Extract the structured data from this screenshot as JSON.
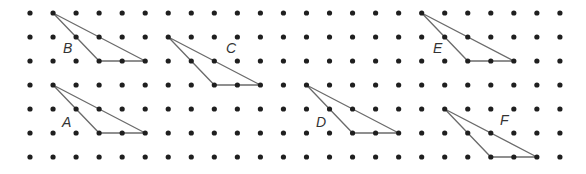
{
  "diagram": {
    "type": "dot-grid-triangles",
    "grid": {
      "columns": 24,
      "rows": 7,
      "origin_x": 30,
      "origin_y": 13,
      "spacing_x": 23.04,
      "spacing_y": 24,
      "dot_radius": 2.6,
      "dot_color": "#1f1f1f"
    },
    "line_color": "#6b6b6b",
    "triangles": [
      {
        "label": "B",
        "vertices": [
          [
            1,
            0
          ],
          [
            3,
            2
          ],
          [
            5,
            2
          ]
        ],
        "label_pos": [
          63,
          53
        ]
      },
      {
        "label": "C",
        "vertices": [
          [
            6,
            1
          ],
          [
            8,
            3
          ],
          [
            10,
            3
          ]
        ],
        "label_pos": [
          226,
          53
        ]
      },
      {
        "label": "E",
        "vertices": [
          [
            17,
            0
          ],
          [
            19,
            2
          ],
          [
            21,
            2
          ]
        ],
        "label_pos": [
          433,
          53
        ]
      },
      {
        "label": "A",
        "vertices": [
          [
            1,
            3
          ],
          [
            3,
            5
          ],
          [
            5,
            5
          ]
        ],
        "label_pos": [
          62,
          127
        ]
      },
      {
        "label": "D",
        "vertices": [
          [
            12,
            3
          ],
          [
            14,
            5
          ],
          [
            16,
            5
          ]
        ],
        "label_pos": [
          316,
          127
        ]
      },
      {
        "label": "F",
        "vertices": [
          [
            18,
            4
          ],
          [
            20,
            6
          ],
          [
            22,
            6
          ]
        ],
        "label_pos": [
          500,
          125
        ]
      }
    ]
  }
}
